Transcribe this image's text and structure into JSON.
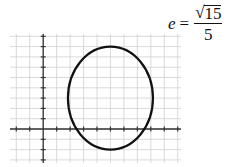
{
  "equation": {
    "lhs": "e",
    "equals": "=",
    "radical_symbol": "√",
    "numerator_radicand": "15",
    "denominator": "5"
  },
  "chart_data": {
    "type": "diagram",
    "title": "",
    "grid": true,
    "x_range": [
      -2,
      10
    ],
    "y_range": [
      -3,
      9
    ],
    "axis_ticks_unit": 1,
    "ellipse": {
      "center": [
        5,
        3
      ],
      "semi_axis_horizontal": 3.16,
      "semi_axis_vertical": 5,
      "major_axis": "vertical",
      "equation": "(x-5)^2/10 + (y-3)^2/25 = 1",
      "eccentricity": "√15/5"
    },
    "colors": {
      "grid": "#d0d0d0",
      "axis": "#333333",
      "curve": "#111111"
    }
  }
}
